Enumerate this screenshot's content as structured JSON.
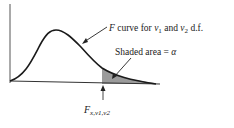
{
  "diagram": {
    "curve_label": {
      "prefix": "F",
      "text": " curve for ",
      "nu1": "ν",
      "nu1_sub": "1",
      "and": " and ",
      "nu2": "ν",
      "nu2_sub": "2",
      "suffix": " d.f."
    },
    "shade_label": {
      "text": "Shaded area = ",
      "alpha": "α"
    },
    "critical_label": {
      "main": "F",
      "sub": "x,ν1,ν2"
    },
    "colors": {
      "curve": "#1a1a1a",
      "shade": "#8a8a8a",
      "axis": "#333333"
    }
  }
}
